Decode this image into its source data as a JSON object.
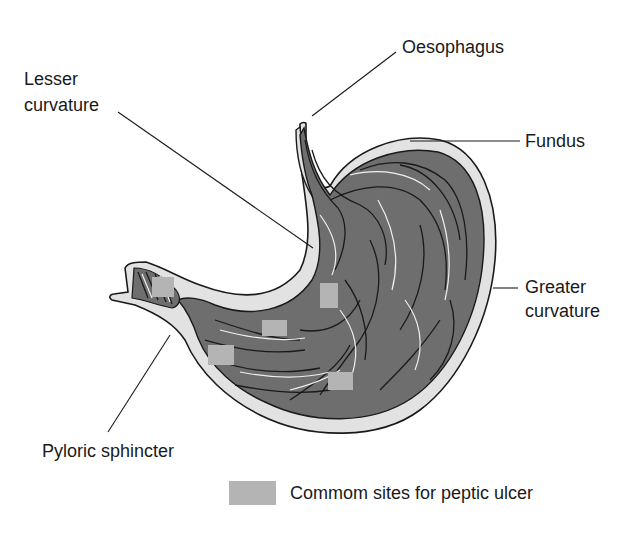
{
  "diagram": {
    "labels": {
      "oesophagus": "Oesophagus",
      "lesser_curvature_line1": "Lesser",
      "lesser_curvature_line2": "curvature",
      "fundus": "Fundus",
      "greater_curvature_line1": "Greater",
      "greater_curvature_line2": "curvature",
      "pyloric_sphincter": "Pyloric sphincter"
    },
    "legend": {
      "label": "Commom sites for peptic ulcer",
      "swatch_color": "#b4b4b4"
    },
    "colors": {
      "wall": "#e2e2e2",
      "mucosa": "#6e6e6e",
      "outline": "#1a1a1a",
      "ulcer_site": "#b4b4b4"
    },
    "ulcer_sites": [
      {
        "x": 152,
        "y": 277,
        "w": 22,
        "h": 20
      },
      {
        "x": 320,
        "y": 283,
        "w": 18,
        "h": 25
      },
      {
        "x": 262,
        "y": 320,
        "w": 25,
        "h": 16
      },
      {
        "x": 208,
        "y": 345,
        "w": 26,
        "h": 20
      },
      {
        "x": 328,
        "y": 372,
        "w": 25,
        "h": 18
      }
    ]
  }
}
